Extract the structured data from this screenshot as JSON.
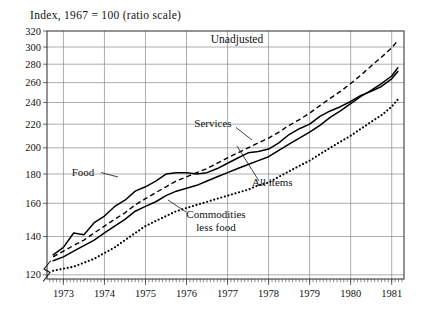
{
  "figure": {
    "subtitle": "Index,  1967  =  100 (ratio scale)",
    "inner_title": "Unadjusted"
  },
  "annotations": {
    "services": "Services",
    "food": "Food",
    "all_items": "All items",
    "commodities_line1": "Commodities",
    "commodities_line2": "less food"
  },
  "chart_data": {
    "type": "line",
    "title": "Unadjusted",
    "subtitle": "Index, 1967 = 100 (ratio scale)",
    "xlabel": "",
    "ylabel": "Index, 1967 = 100",
    "scale": "log",
    "grid": true,
    "legend": "inline-annotations",
    "axis_break": true,
    "xlim": [
      1972.6,
      1981.3
    ],
    "ylim": [
      118,
      320
    ],
    "yticks": [
      120,
      140,
      160,
      180,
      200,
      220,
      240,
      260,
      280,
      300,
      320
    ],
    "xticks": [
      1973,
      1974,
      1975,
      1976,
      1977,
      1978,
      1979,
      1980,
      1981
    ],
    "xtick_labels": [
      "1973",
      "1974",
      "1975",
      "1976",
      "1977",
      "1978",
      "1979",
      "1980",
      "1981"
    ],
    "minor_xticks_per_year": 12,
    "x": [
      1972.75,
      1973.0,
      1973.25,
      1973.5,
      1973.75,
      1974.0,
      1974.25,
      1974.5,
      1974.75,
      1975.0,
      1975.25,
      1975.5,
      1975.75,
      1976.0,
      1976.25,
      1976.5,
      1976.75,
      1977.0,
      1977.25,
      1977.5,
      1977.75,
      1978.0,
      1978.25,
      1978.5,
      1978.75,
      1979.0,
      1979.25,
      1979.5,
      1979.75,
      1980.0,
      1980.25,
      1980.5,
      1980.75,
      1981.0,
      1981.15
    ],
    "series": [
      {
        "name": "Food",
        "style": "solid",
        "values": [
          130,
          134,
          142,
          141,
          148,
          152,
          158,
          162,
          168,
          171,
          175,
          180,
          181,
          181,
          180,
          181,
          184,
          188,
          192,
          196,
          197,
          199,
          204,
          211,
          216,
          220,
          227,
          232,
          236,
          241,
          247,
          251,
          256,
          264,
          272
        ]
      },
      {
        "name": "Services",
        "style": "dashed",
        "values": [
          129,
          132,
          135,
          138,
          142,
          146,
          150,
          154,
          159,
          163,
          167,
          171,
          175,
          178,
          181,
          184,
          188,
          192,
          196,
          200,
          204,
          208,
          213,
          219,
          224,
          230,
          237,
          244,
          251,
          259,
          268,
          278,
          288,
          299,
          308
        ]
      },
      {
        "name": "All items",
        "style": "solid",
        "values": [
          127,
          129,
          132,
          135,
          138,
          142,
          146,
          150,
          155,
          158,
          161,
          165,
          168,
          170,
          172,
          175,
          178,
          181,
          184,
          187,
          190,
          193,
          198,
          203,
          208,
          213,
          219,
          226,
          232,
          239,
          246,
          252,
          259,
          267,
          276
        ]
      },
      {
        "name": "Commodities less food",
        "style": "dotted",
        "values": [
          122,
          123,
          124,
          126,
          128,
          131,
          134,
          138,
          142,
          146,
          149,
          152,
          155,
          157,
          159,
          161,
          163,
          165,
          167,
          169,
          172,
          174,
          178,
          182,
          186,
          190,
          195,
          200,
          205,
          210,
          216,
          222,
          228,
          236,
          243
        ]
      }
    ]
  }
}
